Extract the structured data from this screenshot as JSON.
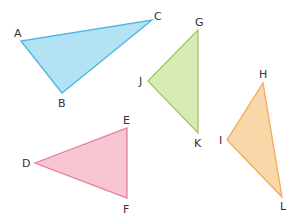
{
  "diagram": {
    "triangles": [
      {
        "id": "ABC",
        "fill": "#b3e2f5",
        "stroke": "#4fb6e3",
        "vertices": [
          {
            "name": "A",
            "x": 21,
            "y": 41,
            "lx": 14,
            "ly": 37
          },
          {
            "name": "B",
            "x": 62,
            "y": 93,
            "lx": 58,
            "ly": 107
          },
          {
            "name": "C",
            "x": 152,
            "y": 20,
            "lx": 154,
            "ly": 20
          }
        ]
      },
      {
        "id": "GJK",
        "fill": "#d9ebb4",
        "stroke": "#9cca5c",
        "vertices": [
          {
            "name": "G",
            "x": 198,
            "y": 30,
            "lx": 195,
            "ly": 26
          },
          {
            "name": "J",
            "x": 148,
            "y": 81,
            "lx": 139,
            "ly": 85
          },
          {
            "name": "K",
            "x": 198,
            "y": 133,
            "lx": 194,
            "ly": 147
          }
        ]
      },
      {
        "id": "HIL",
        "fill": "#fad7a8",
        "stroke": "#f2a95a",
        "vertices": [
          {
            "name": "H",
            "x": 263,
            "y": 83,
            "lx": 259,
            "ly": 78
          },
          {
            "name": "I",
            "x": 227,
            "y": 140,
            "lx": 219,
            "ly": 144
          },
          {
            "name": "L",
            "x": 282,
            "y": 197,
            "lx": 280,
            "ly": 210
          }
        ]
      },
      {
        "id": "DEF",
        "fill": "#f8c6d3",
        "stroke": "#e87a97",
        "vertices": [
          {
            "name": "D",
            "x": 35,
            "y": 163,
            "lx": 22,
            "ly": 167
          },
          {
            "name": "E",
            "x": 127,
            "y": 128,
            "lx": 123,
            "ly": 124
          },
          {
            "name": "F",
            "x": 127,
            "y": 198,
            "lx": 123,
            "ly": 213
          }
        ]
      }
    ]
  }
}
